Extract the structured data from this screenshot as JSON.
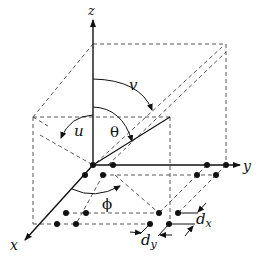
{
  "diagram": {
    "type": "3d-coordinate-geometry",
    "axes": {
      "x": "x",
      "y": "y",
      "z": "z"
    },
    "angles": {
      "theta": "θ",
      "phi": "ϕ",
      "u": "u",
      "v": "v"
    },
    "spacings": {
      "dx": "d",
      "dx_sub": "x",
      "dy": "d",
      "dy_sub": "y"
    },
    "colors": {
      "line": "#111111",
      "dashed": "#444444",
      "background": "#ffffff"
    }
  }
}
